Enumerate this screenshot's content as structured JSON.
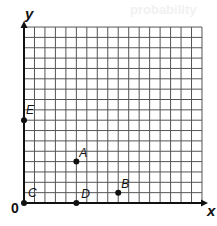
{
  "ghost_text": "probability",
  "grid": {
    "columns": 17,
    "rows": 17,
    "origin_px": [
      24,
      203
    ],
    "cell_w": 10.47,
    "cell_h": 10.35,
    "line_color": "#555555",
    "axis_color": "#111111"
  },
  "axes": {
    "x_label": "x",
    "y_label": "y",
    "origin_label": "0"
  },
  "points": [
    {
      "name": "A",
      "x": 5,
      "y": 4,
      "dot": true
    },
    {
      "name": "B",
      "x": 9,
      "y": 1,
      "dot": true
    },
    {
      "name": "C",
      "x": 0,
      "y": 0,
      "dot": true
    },
    {
      "name": "D",
      "x": 5,
      "y": 0,
      "dot": true
    },
    {
      "name": "E",
      "x": 0,
      "y": 8,
      "dot": true
    }
  ],
  "chart_data": {
    "type": "scatter",
    "title": "",
    "xlabel": "x",
    "ylabel": "y",
    "xlim": [
      0,
      17
    ],
    "ylim": [
      0,
      17
    ],
    "grid": true,
    "points": [
      {
        "label": "A",
        "x": 5,
        "y": 4
      },
      {
        "label": "B",
        "x": 9,
        "y": 1
      },
      {
        "label": "C",
        "x": 0,
        "y": 0
      },
      {
        "label": "D",
        "x": 5,
        "y": 0
      },
      {
        "label": "E",
        "x": 0,
        "y": 8
      }
    ]
  }
}
